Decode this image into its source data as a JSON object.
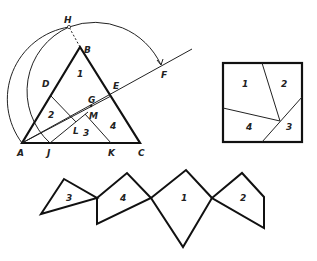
{
  "construction": {
    "points": [
      {
        "label": "H",
        "x": 69,
        "y": 20
      },
      {
        "label": "B",
        "x": 84,
        "y": 53
      },
      {
        "label": "D",
        "x": 44,
        "y": 87
      },
      {
        "label": "E",
        "x": 114,
        "y": 87
      },
      {
        "label": "F",
        "x": 163,
        "y": 75
      },
      {
        "label": "G",
        "x": 90,
        "y": 103
      },
      {
        "label": "M",
        "x": 92,
        "y": 119
      },
      {
        "label": "L",
        "x": 74,
        "y": 133
      },
      {
        "label": "A",
        "x": 17,
        "y": 155
      },
      {
        "label": "J",
        "x": 47,
        "y": 155
      },
      {
        "label": "K",
        "x": 110,
        "y": 155
      },
      {
        "label": "C",
        "x": 139,
        "y": 155
      }
    ],
    "region_labels": [
      {
        "label": "1",
        "x": 78,
        "y": 75
      },
      {
        "label": "2",
        "x": 49,
        "y": 118
      },
      {
        "label": "3",
        "x": 84,
        "y": 135
      },
      {
        "label": "4",
        "x": 112,
        "y": 129
      }
    ]
  },
  "square": {
    "region_labels": [
      {
        "label": "1",
        "x": 242,
        "y": 89
      },
      {
        "label": "2",
        "x": 282,
        "y": 89
      },
      {
        "label": "4",
        "x": 247,
        "y": 131
      },
      {
        "label": "3",
        "x": 287,
        "y": 131
      }
    ]
  },
  "chain": {
    "region_labels": [
      {
        "label": "3",
        "x": 66,
        "y": 202
      },
      {
        "label": "4",
        "x": 121,
        "y": 202
      },
      {
        "label": "1",
        "x": 181,
        "y": 202
      },
      {
        "label": "2",
        "x": 241,
        "y": 202
      }
    ]
  }
}
